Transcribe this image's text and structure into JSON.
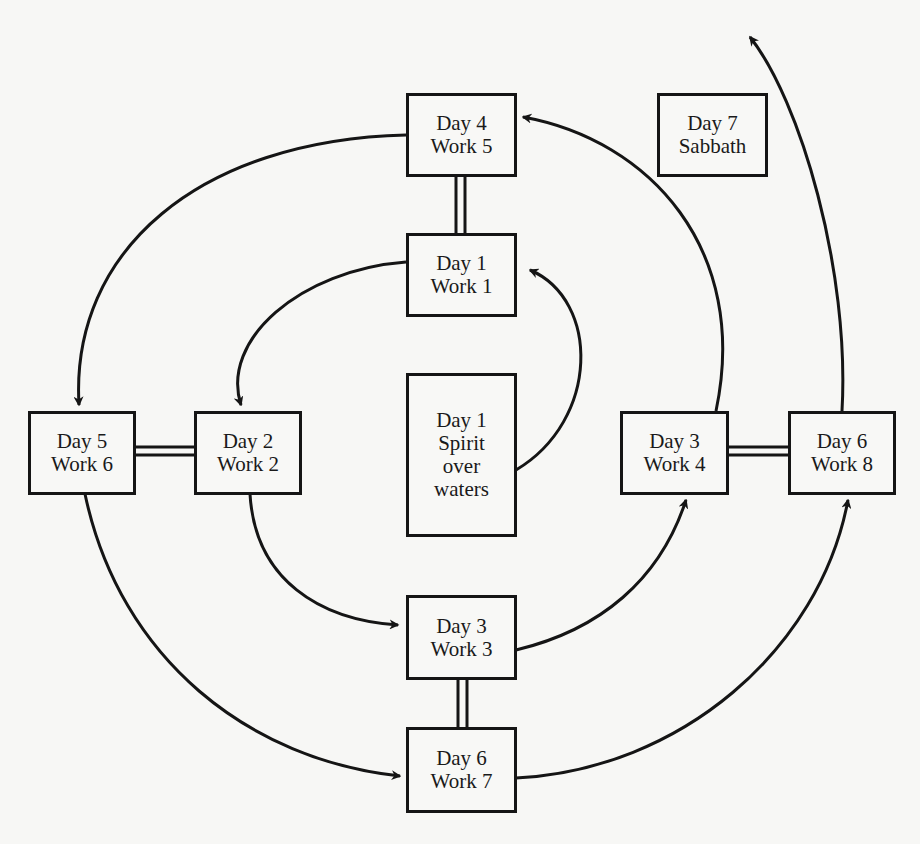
{
  "diagram": {
    "nodes": [
      {
        "id": "d4w5",
        "lines": [
          "Day 4",
          "Work 5"
        ]
      },
      {
        "id": "d1w1",
        "lines": [
          "Day 1",
          "Work 1"
        ]
      },
      {
        "id": "d1spirit",
        "lines": [
          "Day 1",
          "Spirit",
          "over",
          "waters"
        ]
      },
      {
        "id": "d5w6",
        "lines": [
          "Day 5",
          "Work 6"
        ]
      },
      {
        "id": "d2w2",
        "lines": [
          "Day 2",
          "Work 2"
        ]
      },
      {
        "id": "d3w4",
        "lines": [
          "Day 3",
          "Work 4"
        ]
      },
      {
        "id": "d6w8",
        "lines": [
          "Day 6",
          "Work 8"
        ]
      },
      {
        "id": "d3w3",
        "lines": [
          "Day 3",
          "Work 3"
        ]
      },
      {
        "id": "d6w7",
        "lines": [
          "Day 6",
          "Work 7"
        ]
      },
      {
        "id": "d7",
        "lines": [
          "Day 7",
          "Sabbath"
        ]
      }
    ],
    "arrows": [
      {
        "from": "d1spirit",
        "to": "d1w1"
      },
      {
        "from": "d1w1",
        "to": "d2w2"
      },
      {
        "from": "d2w2",
        "to": "d3w3"
      },
      {
        "from": "d3w3",
        "to": "d3w4"
      },
      {
        "from": "d3w4",
        "to": "d4w5"
      },
      {
        "from": "d4w5",
        "to": "d5w6"
      },
      {
        "from": "d5w6",
        "to": "d6w7"
      },
      {
        "from": "d6w7",
        "to": "d6w8"
      },
      {
        "from": "d6w8",
        "to": "off-top"
      }
    ],
    "double_links": [
      [
        "d4w5",
        "d1w1"
      ],
      [
        "d5w6",
        "d2w2"
      ],
      [
        "d3w4",
        "d6w8"
      ],
      [
        "d3w3",
        "d6w7"
      ]
    ],
    "colors": {
      "line": "#151515",
      "background": "#f7f7f5"
    }
  }
}
